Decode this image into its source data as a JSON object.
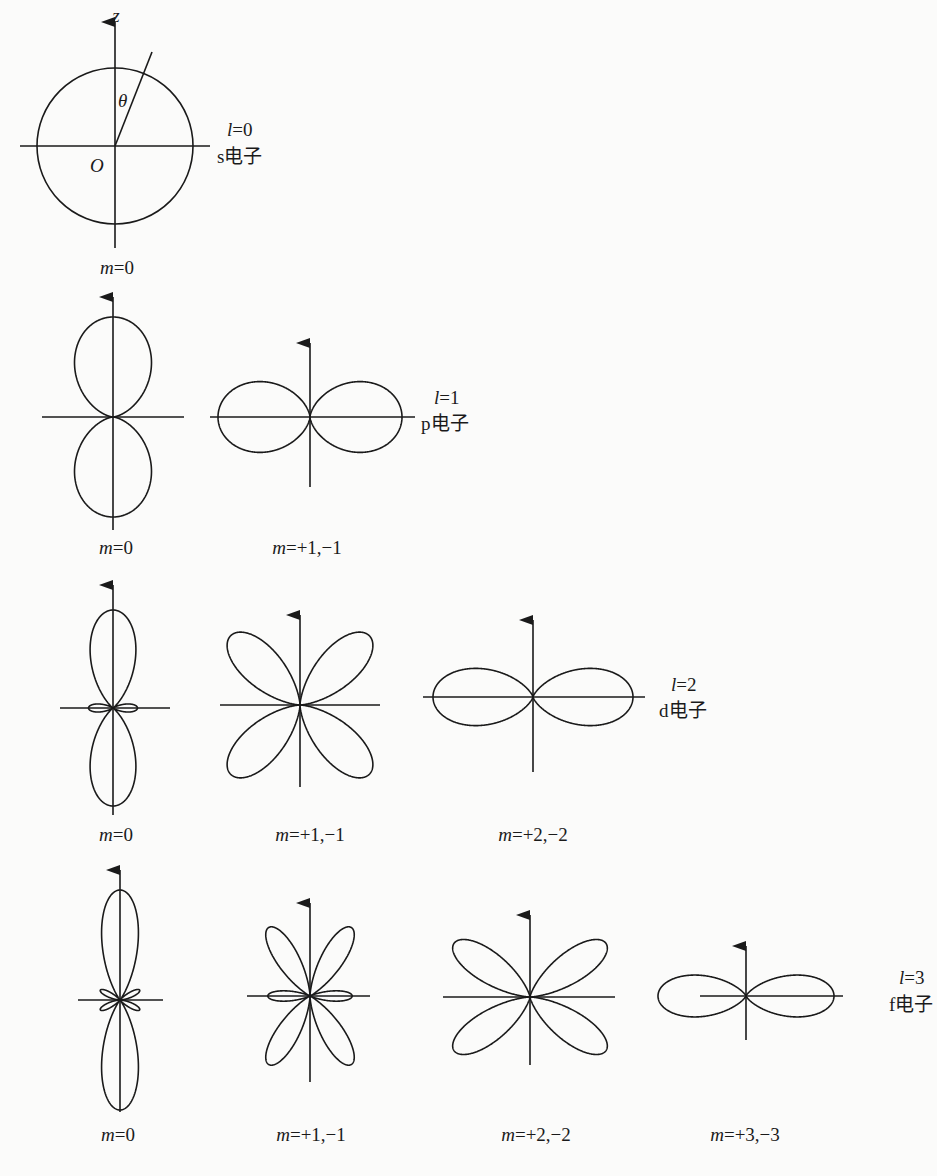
{
  "figure": {
    "ink_color": "#1a1a1a",
    "background": "#fbfbfa",
    "rows": [
      {
        "id": "s",
        "l_label": "l=0",
        "l_italic_symbol": "l",
        "l_value": "=0",
        "electron_label": "s电子",
        "axis_labels": {
          "z": "z",
          "theta": "θ",
          "origin": "O"
        },
        "orbitals": [
          {
            "m_label_symbol": "m",
            "m_label_value": "=0",
            "shape": "circle",
            "l": 0,
            "m": 0
          }
        ]
      },
      {
        "id": "p",
        "l_italic_symbol": "l",
        "l_value": "=1",
        "electron_label": "p电子",
        "orbitals": [
          {
            "m_label_symbol": "m",
            "m_label_value": "=0",
            "l": 1,
            "m": 0
          },
          {
            "m_label_symbol": "m",
            "m_label_value": "=+1,−1",
            "l": 1,
            "m": 1
          }
        ]
      },
      {
        "id": "d",
        "l_italic_symbol": "l",
        "l_value": "=2",
        "electron_label": "d电子",
        "orbitals": [
          {
            "m_label_symbol": "m",
            "m_label_value": "=0",
            "l": 2,
            "m": 0
          },
          {
            "m_label_symbol": "m",
            "m_label_value": "=+1,−1",
            "l": 2,
            "m": 1
          },
          {
            "m_label_symbol": "m",
            "m_label_value": "=+2,−2",
            "l": 2,
            "m": 2
          }
        ]
      },
      {
        "id": "f",
        "l_italic_symbol": "l",
        "l_value": "=3",
        "electron_label": "f电子",
        "orbitals": [
          {
            "m_label_symbol": "m",
            "m_label_value": "=0",
            "l": 3,
            "m": 0
          },
          {
            "m_label_symbol": "m",
            "m_label_value": "=+1,−1",
            "l": 3,
            "m": 1
          },
          {
            "m_label_symbol": "m",
            "m_label_value": "=+2,−2",
            "l": 3,
            "m": 2
          },
          {
            "m_label_symbol": "m",
            "m_label_value": "=+3,−3",
            "l": 3,
            "m": 3
          }
        ]
      }
    ]
  }
}
